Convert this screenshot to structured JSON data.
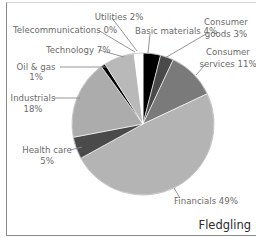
{
  "chart_data": {
    "type": "pie",
    "title": "Fledgling",
    "start_angle": "top, clockwise",
    "slices": [
      {
        "label": "Basic materials",
        "value": 4,
        "display": "Basic materials 4%",
        "color": "#000000"
      },
      {
        "label": "Consumer goods",
        "value": 3,
        "display": "Consumer goods 3%",
        "color": "#4a4a4a"
      },
      {
        "label": "Consumer services",
        "value": 11,
        "display": "Consumer services 11%",
        "color": "#7a7a7a"
      },
      {
        "label": "Financials",
        "value": 49,
        "display": "Financials 49%",
        "color": "#b4b4b4"
      },
      {
        "label": "Health care",
        "value": 5,
        "display": "Health care 5%",
        "color": "#4a4a4a"
      },
      {
        "label": "Industrials",
        "value": 18,
        "display": "Industrials 18%",
        "color": "#acacac"
      },
      {
        "label": "Oil & gas",
        "value": 1,
        "display": "Oil & gas 1%",
        "color": "#000000"
      },
      {
        "label": "Technology",
        "value": 7,
        "display": "Technology 7%",
        "color": "#b9b9b9"
      },
      {
        "label": "Telecommunications",
        "value": 0,
        "display": "Telecommunications 0%",
        "color": "#ffffff"
      },
      {
        "label": "Utilities",
        "value": 2,
        "display": "Utilities 2%",
        "color": "#ffffff"
      }
    ],
    "unit": "%"
  },
  "labels": {
    "utilities": "Utilities 2%",
    "telecom": "Telecommunications 0%",
    "technology": "Technology 7%",
    "oil_gas_1": "Oil & gas",
    "oil_gas_2": "1%",
    "basic_materials": "Basic materials 4%",
    "consumer_goods_1": "Consumer",
    "consumer_goods_2": "goods 3%",
    "consumer_services_1": "Consumer",
    "consumer_services_2": "services 11%",
    "industrials_1": "Industrials",
    "industrials_2": "18%",
    "health_care_1": "Health care",
    "health_care_2": "5%",
    "financials": "Financials 49%"
  },
  "title": "Fledgling"
}
